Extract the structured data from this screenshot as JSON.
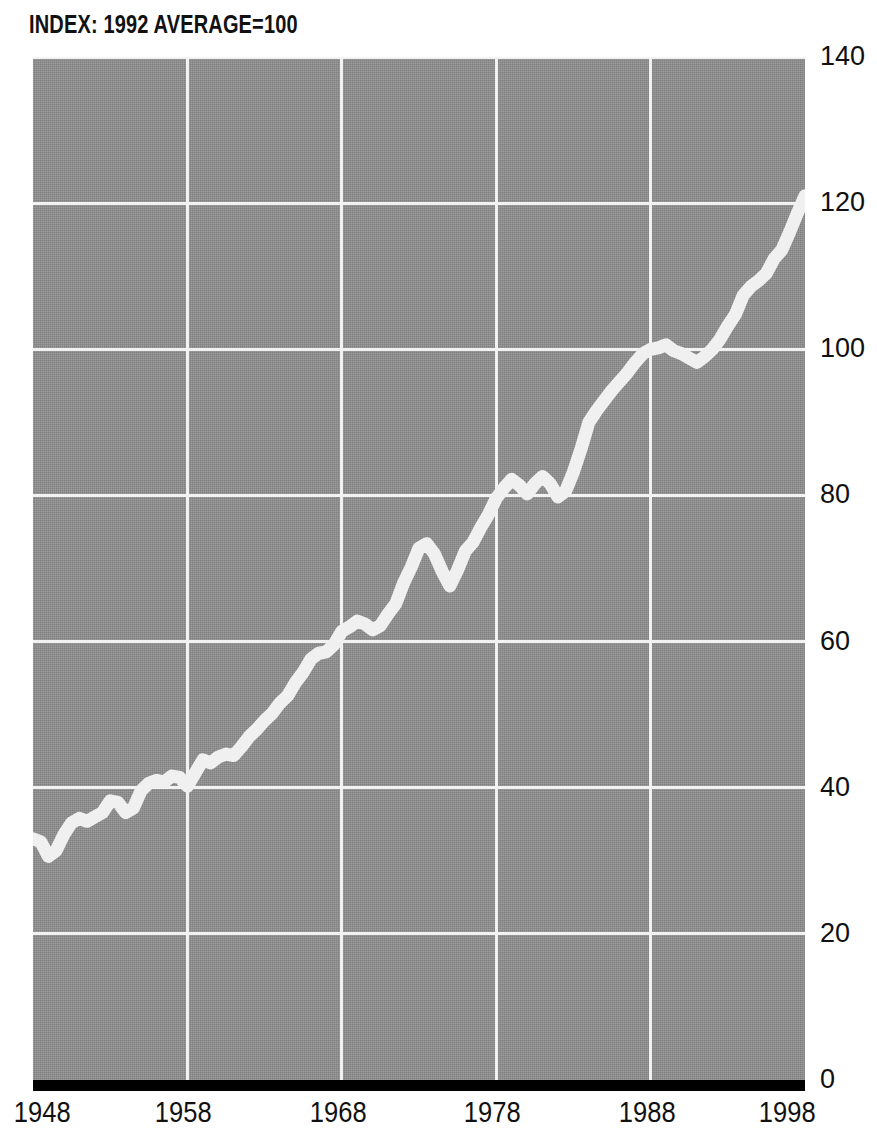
{
  "chart_data": {
    "type": "line",
    "title": "INDEX: 1992 AVERAGE=100",
    "xlabel": "",
    "ylabel": "",
    "xlim": [
      1948,
      1998
    ],
    "ylim": [
      0,
      140
    ],
    "xticks": [
      "1948",
      "1958",
      "1968",
      "1978",
      "1988",
      "1998"
    ],
    "yticks": [
      "0",
      "20",
      "40",
      "60",
      "80",
      "100",
      "120",
      "140"
    ],
    "grid": true,
    "legend": "none",
    "series": [
      {
        "name": "Index (1992 average = 100)",
        "color": "#f0f0f0",
        "x": [
          1948,
          1948.5,
          1949,
          1949.5,
          1950,
          1950.5,
          1951,
          1951.5,
          1952,
          1952.5,
          1953,
          1953.5,
          1954,
          1954.5,
          1955,
          1955.5,
          1956,
          1956.5,
          1957,
          1957.5,
          1958,
          1958.5,
          1959,
          1959.5,
          1960,
          1960.5,
          1961,
          1961.5,
          1962,
          1962.5,
          1963,
          1963.5,
          1964,
          1964.5,
          1965,
          1965.5,
          1966,
          1966.5,
          1967,
          1967.5,
          1968,
          1968.5,
          1969,
          1969.5,
          1970,
          1970.5,
          1971,
          1971.5,
          1972,
          1972.5,
          1973,
          1973.5,
          1974,
          1974.5,
          1975,
          1975.5,
          1976,
          1976.5,
          1977,
          1977.5,
          1978,
          1978.5,
          1979,
          1979.5,
          1980,
          1980.5,
          1981,
          1981.5,
          1982,
          1982.5,
          1983,
          1983.5,
          1984,
          1984.5,
          1985,
          1985.5,
          1986,
          1986.5,
          1987,
          1987.5,
          1988,
          1988.5,
          1989,
          1989.5,
          1990,
          1990.5,
          1991,
          1991.5,
          1992,
          1992.5,
          1993,
          1993.5,
          1994,
          1994.5,
          1995,
          1995.5,
          1996,
          1996.5,
          1997,
          1997.5,
          1998
        ],
        "values": [
          33.0,
          32.6,
          30.6,
          31.4,
          33.6,
          35.2,
          35.8,
          35.4,
          36.0,
          36.6,
          38.2,
          38.0,
          36.6,
          37.2,
          39.6,
          40.6,
          41.0,
          40.8,
          41.6,
          41.4,
          40.2,
          42.0,
          43.8,
          43.4,
          44.2,
          44.6,
          44.4,
          45.6,
          47.0,
          48.0,
          49.2,
          50.2,
          51.6,
          52.6,
          54.4,
          55.8,
          57.6,
          58.4,
          58.6,
          59.6,
          61.4,
          62.0,
          62.8,
          62.4,
          61.6,
          62.2,
          63.8,
          65.2,
          68.0,
          70.2,
          72.8,
          73.4,
          72.0,
          69.6,
          67.6,
          69.8,
          72.4,
          73.6,
          75.6,
          77.4,
          79.6,
          81.0,
          82.2,
          81.4,
          80.2,
          81.6,
          82.6,
          81.6,
          79.8,
          80.6,
          83.2,
          86.4,
          90.0,
          91.6,
          93.0,
          94.4,
          95.6,
          96.8,
          98.2,
          99.4,
          100.0,
          100.2,
          100.6,
          99.8,
          99.4,
          98.8,
          98.2,
          99.0,
          100.0,
          101.4,
          103.2,
          104.8,
          107.4,
          108.6,
          109.4,
          110.4,
          112.4,
          113.6,
          116.0,
          118.6,
          121.0
        ]
      }
    ],
    "colors": {
      "plot_background": "#909090",
      "gridline": "#f2f2f2",
      "series_line": "#f0f0f0",
      "axis_bar": "#000000",
      "text": "#111111",
      "page_background": "#ffffff"
    }
  }
}
